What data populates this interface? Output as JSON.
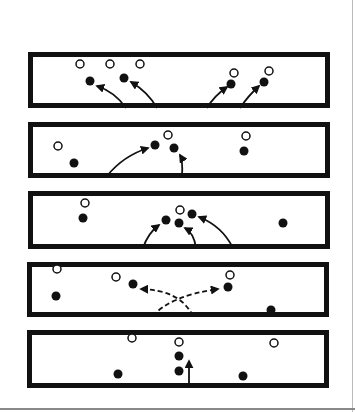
{
  "diagram": {
    "colors": {
      "ink": "#111111",
      "background": "#ffffff"
    },
    "panels": [
      {
        "id": 1,
        "box": [
          28,
          52,
          302,
          56
        ],
        "open": [
          [
            80,
            64
          ],
          [
            110,
            64
          ],
          [
            140,
            64
          ],
          [
            234,
            73
          ],
          [
            269,
            71
          ]
        ],
        "filled": [
          [
            90,
            81
          ],
          [
            124,
            78
          ],
          [
            231,
            84
          ],
          [
            264,
            82
          ]
        ],
        "arrows": [
          {
            "d": "M126,108 Q115,92 97,86",
            "dashed": false
          },
          {
            "d": "M157,108 Q148,92 131,82",
            "dashed": false
          },
          {
            "d": "M207,108 Q214,96 227,87",
            "dashed": false
          },
          {
            "d": "M240,108 Q248,96 259,86",
            "dashed": false
          }
        ]
      },
      {
        "id": 2,
        "box": [
          28,
          122,
          302,
          56
        ],
        "open": [
          [
            58,
            146
          ],
          [
            168,
            135
          ],
          [
            246,
            136
          ]
        ],
        "filled": [
          [
            74,
            163
          ],
          [
            155,
            145
          ],
          [
            174,
            148
          ],
          [
            244,
            151
          ]
        ],
        "arrows": [
          {
            "d": "M107,176 Q123,156 148,148",
            "dashed": false
          },
          {
            "d": "M182,176 Q183,160 180,155",
            "dashed": false
          }
        ]
      },
      {
        "id": 3,
        "box": [
          28,
          191,
          302,
          58
        ],
        "open": [
          [
            85,
            203
          ],
          [
            180,
            210
          ]
        ],
        "filled": [
          [
            83,
            218
          ],
          [
            166,
            220
          ],
          [
            179,
            223
          ],
          [
            192,
            214
          ],
          [
            283,
            223
          ]
        ],
        "arrows": [
          {
            "d": "M143,248 Q148,233 159,225",
            "dashed": false
          },
          {
            "d": "M196,248 Q194,233 185,228",
            "dashed": false
          },
          {
            "d": "M233,248 Q222,226 199,217",
            "dashed": false
          }
        ]
      },
      {
        "id": 4,
        "box": [
          27,
          262,
          302,
          55
        ],
        "open": [
          [
            57,
            269
          ],
          [
            116,
            277
          ],
          [
            230,
            275
          ]
        ],
        "filled": [
          [
            56,
            296
          ],
          [
            133,
            284
          ],
          [
            228,
            287
          ],
          [
            271,
            310
          ]
        ],
        "arrows": [
          {
            "d": "M193,316 Q180,290 141,289",
            "dashed": true
          },
          {
            "d": "M153,316 Q170,296 218,289",
            "dashed": true
          }
        ]
      },
      {
        "id": 5,
        "box": [
          27,
          330,
          302,
          58
        ],
        "open": [
          [
            132,
            338
          ],
          [
            179,
            342
          ],
          [
            274,
            343
          ]
        ],
        "filled": [
          [
            118,
            374
          ],
          [
            179,
            356
          ],
          [
            179,
            371
          ],
          [
            243,
            376
          ]
        ],
        "arrows": [
          {
            "d": "M189,387 L189,361",
            "dashed": false
          }
        ]
      }
    ]
  }
}
